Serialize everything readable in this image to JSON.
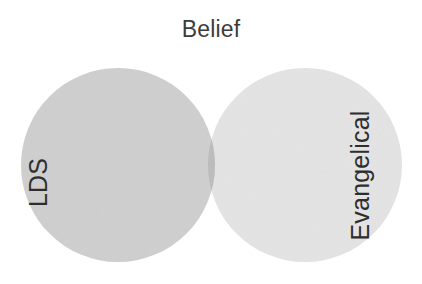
{
  "chart_data": {
    "type": "venn",
    "title": "Belief",
    "xlabel": "",
    "ylabel": "",
    "grid": false,
    "legend": "none",
    "sets": [
      {
        "name": "LDS",
        "label": "LDS",
        "fill": "#cfcfcf",
        "cx": 118,
        "cy": 165,
        "r": 97,
        "label_rotation": -90,
        "label_x": 38,
        "label_y": 169
      },
      {
        "name": "Evangelical",
        "label": "Evangelical",
        "fill": "#e4e4e4",
        "cx": 305,
        "cy": 165,
        "r": 97,
        "label_rotation": -90,
        "label_x": 360,
        "label_y": 162
      }
    ],
    "intersection": {
      "name": "LDS-and-Evangelical",
      "label": "",
      "fill": "#bcbcbc"
    },
    "background": "#ffffff",
    "title_color": "#3c3c3c",
    "label_color": "#2e2e2e"
  },
  "figure": {
    "title": "Belief",
    "left_set_label": "LDS",
    "right_set_label": "Evangelical"
  }
}
